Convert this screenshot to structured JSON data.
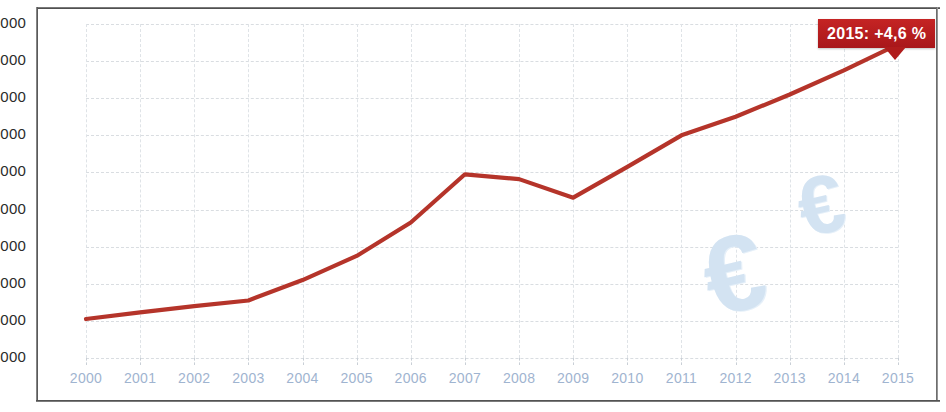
{
  "chart_data": {
    "type": "line",
    "title": "",
    "xlabel": "",
    "ylabel": "",
    "categories": [
      "2000",
      "2001",
      "2002",
      "2003",
      "2004",
      "2005",
      "2006",
      "2007",
      "2008",
      "2009",
      "2010",
      "2011",
      "2012",
      "2013",
      "2014",
      "2015"
    ],
    "values": [
      10050,
      10230,
      10400,
      10550,
      11100,
      11750,
      12650,
      13950,
      13820,
      13320,
      14150,
      15000,
      15500,
      16100,
      16750,
      17450
    ],
    "series": [
      {
        "name": "",
        "values": [
          10050,
          10230,
          10400,
          10550,
          11100,
          11750,
          12650,
          13950,
          13820,
          13320,
          14150,
          15000,
          15500,
          16100,
          16750,
          17450
        ],
        "color": "#b5342a"
      }
    ],
    "ylim": [
      9000,
      18000
    ],
    "ytick_labels": [
      "18000",
      "17000",
      "16000",
      "15000",
      "14000",
      "13000",
      "12000",
      "11000",
      "10000",
      "9000"
    ],
    "ytick_values": [
      18000,
      17000,
      16000,
      15000,
      14000,
      13000,
      12000,
      11000,
      10000,
      9000
    ],
    "xtick_labels": [
      "2000",
      "2001",
      "2002",
      "2003",
      "2004",
      "2005",
      "2006",
      "2007",
      "2008",
      "2009",
      "2010",
      "2011",
      "2012",
      "2013",
      "2014",
      "2015"
    ],
    "grid": "dashed-both",
    "legend": "none",
    "annotations": [
      {
        "name": "growth-callout",
        "text": "2015: +4,6 %",
        "target_year": "2015",
        "background_color": "#b01c1c",
        "text_color": "#ffffff"
      }
    ],
    "watermarks": [
      {
        "name": "euro-large",
        "glyph": "€"
      },
      {
        "name": "euro-small",
        "glyph": "€"
      }
    ],
    "colors": {
      "line": "#b5342a",
      "ytick_text": "#2b2b2b",
      "xtick_text": "#9fb4d0",
      "gridline": "#d9dde1",
      "watermark": "#d3e3f2",
      "callout": "#b01c1c"
    }
  }
}
